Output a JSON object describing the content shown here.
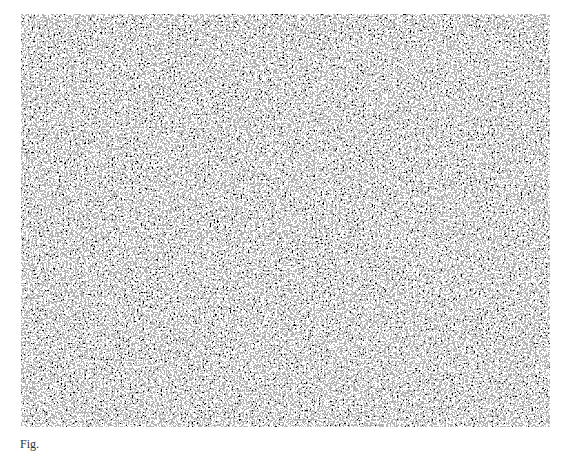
{
  "figure": {
    "type": "random-dot stereogram",
    "colors": {
      "dark": "#000000",
      "light": "#ffffff"
    }
  },
  "caption": {
    "text": "Fig."
  }
}
